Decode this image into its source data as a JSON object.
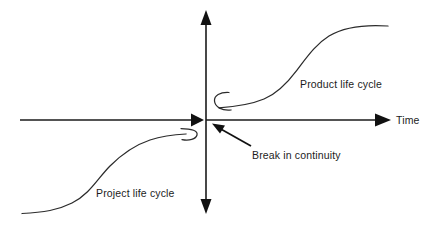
{
  "figure": {
    "kind": "line-diagram",
    "background_color": "#ffffff",
    "stroke_color": "#2b2b2b",
    "axis_color": "#1a1a1a",
    "text_color": "#1c1c1c"
  },
  "axes": {
    "horizontal": {
      "label": "Time",
      "label_x": 396,
      "label_y": 124,
      "y": 120,
      "x_start": 20,
      "x_end": 390,
      "arrow_right_at_x": 390,
      "arrow_left_inner_at_x": 203,
      "has_right_arrow": true,
      "has_inner_arrow": true
    },
    "vertical": {
      "label": "",
      "x": 206,
      "y_top": 12,
      "y_bottom": 212,
      "has_top_arrow": true,
      "has_bottom_arrow": true
    },
    "origin": {
      "x": 206,
      "y": 120
    }
  },
  "curves": [
    {
      "name": "project-life-cycle",
      "label": "Project life cycle",
      "label_x": 96,
      "label_y": 197,
      "quadrant": "lower-left",
      "description": "S-shaped growth curve rising from bottom-left toward the origin, ending in a small upward hook just left of the vertical axis",
      "start_point": [
        22,
        213
      ],
      "end_point": [
        196,
        133
      ],
      "hook": "open curl opening to the left near (188,134)"
    },
    {
      "name": "product-life-cycle",
      "label": "Product life cycle",
      "label_x": 300,
      "label_y": 88,
      "quadrant": "upper-right",
      "description": "S-shaped growth curve starting in a small hook just right of the vertical axis and rising to a plateau at the upper right",
      "start_point": [
        219,
        108
      ],
      "end_point": [
        388,
        26
      ],
      "hook": "open C curl opening to the right near (222,101)"
    }
  ],
  "annotations": [
    {
      "name": "break-in-continuity",
      "label": "Break in continuity",
      "label_x": 252,
      "label_y": 159,
      "pointer_from": [
        250,
        145
      ],
      "pointer_to": [
        214,
        124
      ],
      "has_arrow_head": true
    }
  ]
}
